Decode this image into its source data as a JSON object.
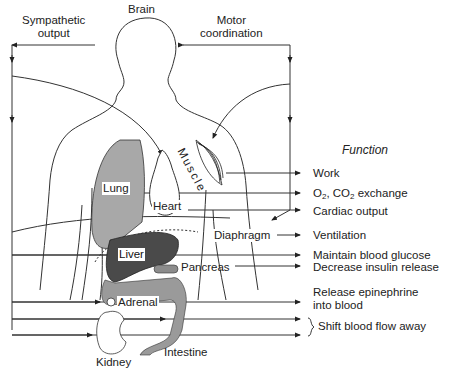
{
  "diagram": {
    "header_labels": {
      "brain": "Brain",
      "sympathetic_output": "Sympathetic\noutput",
      "motor_coordination": "Motor\ncoordination",
      "function_heading": "Function"
    },
    "organs": {
      "lung": "Lung",
      "heart": "Heart",
      "muscle": "Muscle",
      "diaphragm": "Diaphragm",
      "liver": "Liver",
      "pancreas": "Pancreas",
      "adrenal": "Adrenal",
      "kidney": "Kidney",
      "intestine": "Intestine"
    },
    "functions": [
      {
        "organ": "muscle",
        "text": "Work"
      },
      {
        "organ": "lung",
        "text_parts": [
          "O",
          "2",
          ", CO",
          "2",
          " exchange"
        ]
      },
      {
        "organ": "heart",
        "text": "Cardiac output"
      },
      {
        "organ": "diaphragm",
        "text": "Ventilation"
      },
      {
        "organ": "liver",
        "text": "Maintain blood glucose"
      },
      {
        "organ": "pancreas",
        "text": "Decrease insulin release"
      },
      {
        "organ": "adrenal",
        "text": "Release epinephrine\ninto blood"
      },
      {
        "organ": "kidney+intestine",
        "text": "Shift blood flow away"
      }
    ],
    "colors": {
      "line": "#333333",
      "lung_fill": "#a8a8a8",
      "liver_fill": "#4a4a4a",
      "intestine_fill": "#9a9a9a",
      "pancreas_fill": "#8c8c8c"
    }
  }
}
